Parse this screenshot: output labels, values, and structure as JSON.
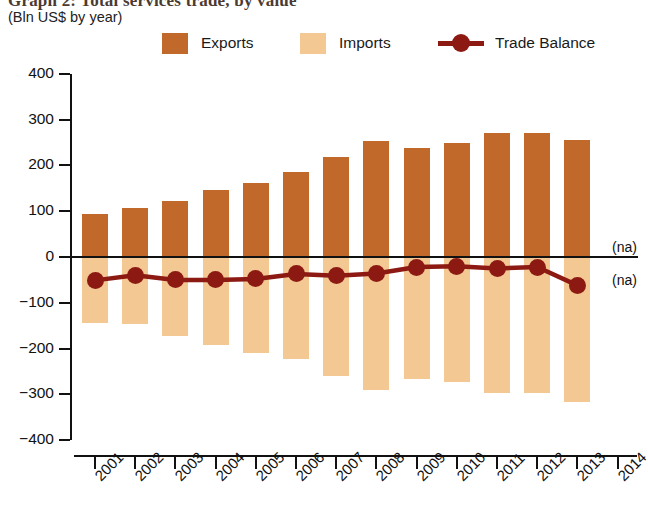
{
  "title": {
    "main": "Graph 2:  Total services trade, by value",
    "sub": "(Bln US$ by year)"
  },
  "legend": {
    "items": [
      {
        "label": "Exports",
        "color": "#C1682B",
        "type": "swatch"
      },
      {
        "label": "Imports",
        "color": "#F3C893",
        "type": "swatch"
      },
      {
        "label": "Trade Balance",
        "color": "#8C1A13",
        "type": "line-marker"
      }
    ]
  },
  "annotations": [
    {
      "text": "(na)",
      "x": 612,
      "y": 239
    },
    {
      "text": "(na)",
      "x": 612,
      "y": 272
    }
  ],
  "colors": {
    "exports": "#C1682B",
    "imports": "#F3C893",
    "trade_balance": "#8C1A13",
    "axis": "#111111"
  },
  "chart_data": {
    "type": "bar",
    "title": "Graph 2:  Total services trade, by value",
    "subtitle": "(Bln US$ by year)",
    "xlabel": "",
    "ylabel": "Bln US$ by year",
    "ylim": [
      -400,
      400
    ],
    "ytick_values": [
      400,
      300,
      200,
      100,
      0,
      -100,
      -200,
      -300,
      -400
    ],
    "ytick_labels": [
      "400",
      "300",
      "200",
      "100",
      "0",
      "−100",
      "−200",
      "−300",
      "−400"
    ],
    "categories": [
      "2001",
      "2002",
      "2003",
      "2004",
      "2005",
      "2006",
      "2007",
      "2008",
      "2009",
      "2010",
      "2011",
      "2012",
      "2013",
      "2014"
    ],
    "grid": false,
    "legend_position": "top",
    "series": [
      {
        "name": "Exports",
        "type": "bar",
        "color": "#C1682B",
        "values": [
          94,
          107,
          123,
          146,
          162,
          186,
          218,
          254,
          238,
          248,
          271,
          270,
          255,
          null
        ]
      },
      {
        "name": "Imports",
        "type": "bar",
        "color": "#F3C893",
        "values": [
          -145,
          -147,
          -173,
          -192,
          -210,
          -223,
          -259,
          -290,
          -266,
          -272,
          -296,
          -296,
          -317,
          null
        ]
      },
      {
        "name": "Trade Balance",
        "type": "line",
        "color": "#8C1A13",
        "values": [
          -51,
          -40,
          -50,
          -50,
          -48,
          -37,
          -41,
          -36,
          -22,
          -20,
          -25,
          -22,
          -62,
          null
        ]
      }
    ]
  }
}
